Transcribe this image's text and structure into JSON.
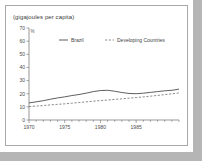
{
  "chart_data": {
    "type": "line",
    "title": "(gigajoules per capita)",
    "xlabel": "",
    "ylabel": "(gigajoules per capita)",
    "unit_marker": "%",
    "ylim": [
      0,
      70
    ],
    "xlim": [
      1970,
      1991
    ],
    "yticks": [
      0,
      10,
      20,
      30,
      40,
      50,
      60,
      70
    ],
    "ytick_labels": [
      "0",
      "10",
      "20",
      "30",
      "40",
      "50",
      "60",
      "70"
    ],
    "xticks": [
      1970,
      1975,
      1980,
      1985
    ],
    "xtick_labels": [
      "1970",
      "1975",
      "1980",
      "1985"
    ],
    "x_minor_ticks": [
      1971,
      1972,
      1973,
      1974,
      1976,
      1977,
      1978,
      1979,
      1981,
      1982,
      1983,
      1984,
      1986,
      1987,
      1988,
      1989,
      1990,
      1991
    ],
    "grid": false,
    "legend_position": "top-center",
    "x": [
      1970,
      1971,
      1972,
      1973,
      1974,
      1975,
      1976,
      1977,
      1978,
      1979,
      1980,
      1981,
      1982,
      1983,
      1984,
      1985,
      1986,
      1987,
      1988,
      1989,
      1990,
      1991
    ],
    "series": [
      {
        "name": "Brazil",
        "style": "solid",
        "color": "#4d4d4d",
        "values": [
          13.0,
          13.8,
          14.7,
          15.8,
          16.8,
          17.6,
          18.6,
          19.4,
          20.4,
          21.6,
          22.4,
          22.6,
          21.9,
          20.9,
          20.2,
          20.0,
          20.4,
          21.0,
          21.6,
          22.2,
          22.6,
          23.5
        ]
      },
      {
        "name": "Developing Countries",
        "style": "dashed",
        "color": "#6e6e6e",
        "values": [
          10.2,
          10.6,
          11.0,
          11.5,
          11.9,
          12.3,
          12.8,
          13.3,
          13.8,
          14.3,
          14.8,
          15.2,
          15.7,
          16.1,
          16.6,
          17.1,
          17.6,
          18.1,
          18.7,
          19.3,
          19.9,
          20.6
        ]
      }
    ]
  },
  "legend": {
    "brazil_label": "Brazil",
    "developing_label": "Developing Countries"
  }
}
